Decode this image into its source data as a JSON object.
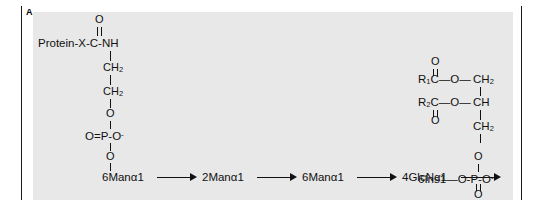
{
  "figure": {
    "panel_letter": "A",
    "background_color": "#e8e8e8",
    "ink_color": "#111111"
  },
  "protein_arm": {
    "carbonyl_oxygen": "O",
    "protein_label": "Protein-X-C-NH",
    "ch2_upper": "CH",
    "ch2_upper_sub": "2",
    "ch2_lower": "CH",
    "ch2_lower_sub": "2",
    "ester_oxygen_upper": "O",
    "phosphate": "O=P-O",
    "phosphate_charge": "-",
    "ester_oxygen_lower": "O"
  },
  "glycan_chain": {
    "residues": [
      {
        "label": "6Manα1"
      },
      {
        "label": "2Manα1"
      },
      {
        "label": "6Manα1"
      },
      {
        "label": "4GlcNα1"
      },
      {
        "label": "6Ins1"
      }
    ],
    "arrow_count": 4,
    "terminal_linkage": "O-P-O",
    "terminal_dash": "—",
    "terminal_charge": "-"
  },
  "lipid": {
    "r1_label": "R",
    "r1_sub": "1",
    "r1_carbon": "C",
    "r1_carbonyl_oxygen": "O",
    "r1_ester_oxygen": "O",
    "r2_label": "R",
    "r2_sub": "2",
    "r2_carbon": "C",
    "r2_carbonyl_oxygen": "O",
    "r2_ester_oxygen": "O",
    "glycerol_c1": "CH",
    "glycerol_c1_sub": "2",
    "glycerol_c2": "CH",
    "glycerol_c3": "CH",
    "glycerol_c3_sub": "2",
    "glycerol_oxygen": "O",
    "dash_1": "—",
    "dash_2": "—",
    "dash_3": "—",
    "dash_4": "—"
  },
  "inositol_phosphate": {
    "top_oxygen": "O",
    "bottom_oxygen": "O"
  }
}
